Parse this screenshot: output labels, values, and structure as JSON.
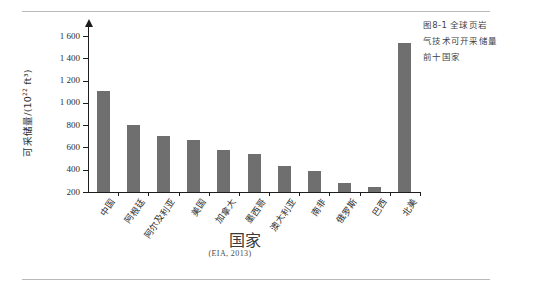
{
  "figure": {
    "caption_lines": [
      "图8-1  全球页岩",
      "气技术可开采储量",
      "前十国家"
    ],
    "source_note": "(EIA, 2013)"
  },
  "chart_data": {
    "type": "bar",
    "xlabel": "国家",
    "ylabel": "可采储量/(10²² ft³)",
    "ylabel_base": "可采储量/(10",
    "ylabel_exp": "22",
    "ylabel_tail": " ft³)",
    "categories": [
      "中国",
      "阿根廷",
      "阿尔及利亚",
      "美国",
      "加拿大",
      "墨西哥",
      "澳大利亚",
      "南非",
      "俄罗斯",
      "巴西",
      "北美"
    ],
    "values": [
      1110,
      805,
      707,
      665,
      573,
      545,
      437,
      390,
      285,
      245,
      1535
    ],
    "ylim": [
      200,
      1700
    ],
    "yticks": [
      200,
      400,
      600,
      800,
      1000,
      1200,
      1400,
      1600
    ],
    "ytick_labels": [
      "200",
      "400",
      "600",
      "800",
      "1 000",
      "1 200",
      "1 400",
      "1 600"
    ],
    "grid": false,
    "legend": "none",
    "bar_color": "#706f70",
    "axis_color": "#1d1d1d"
  }
}
